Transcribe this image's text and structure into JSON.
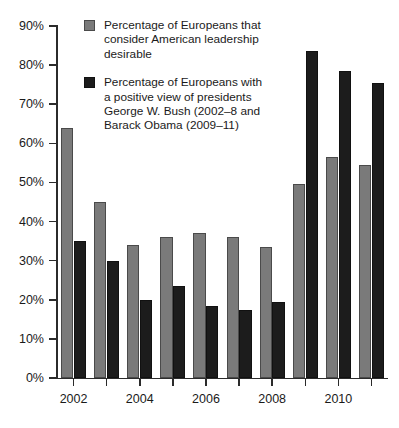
{
  "chart_data": {
    "type": "bar",
    "title": "",
    "subtitle": "",
    "xlabel": "",
    "ylabel": "",
    "ylim": [
      0,
      90
    ],
    "ytick_labels": [
      "0%",
      "10%",
      "20%",
      "30%",
      "40%",
      "50%",
      "60%",
      "70%",
      "80%",
      "90%"
    ],
    "ytick_values": [
      0,
      10,
      20,
      30,
      40,
      50,
      60,
      70,
      80,
      90
    ],
    "grid": false,
    "legend_position": "top-center",
    "categories": [
      "2002",
      "2003",
      "2004",
      "2005",
      "2006",
      "2007",
      "2008",
      "2009",
      "2010",
      "2011"
    ],
    "xtick_labels_shown": [
      "2002",
      "2004",
      "2006",
      "2008",
      "2010"
    ],
    "series": [
      {
        "name": "Percentage of Europeans that consider American leadership desirable",
        "color": "#7a7a7a",
        "values": [
          64,
          45,
          34,
          36,
          37,
          36,
          33.5,
          49.5,
          56.5,
          54.5
        ]
      },
      {
        "name": "Percentage of Europeans with a positive view of presidents George W. Bush (2002–8 and Barack Obama (2009–11)",
        "color": "#1c1c1c",
        "values": [
          35,
          30,
          20,
          23.5,
          18.5,
          17.5,
          19.5,
          83.5,
          78.5,
          75.5
        ]
      }
    ]
  },
  "legend": {
    "entries": [
      {
        "swatch": "gray",
        "lines": [
          "Percentage of Europeans that",
          "consider American leadership",
          "desirable"
        ]
      },
      {
        "swatch": "black",
        "lines": [
          "Percentage of Europeans with",
          "a positive view of presidents",
          "George W. Bush (2002–8 and",
          "Barack Obama (2009–11)"
        ]
      }
    ]
  }
}
